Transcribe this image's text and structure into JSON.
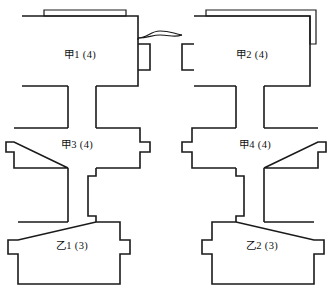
{
  "diagram": {
    "type": "floor-plan-line-drawing",
    "background_color": "#ffffff",
    "line_color": "#1a1a1a",
    "units": [
      {
        "id": "jia-1",
        "label": "甲1 (4)",
        "name_part": "甲1",
        "count": "(4)",
        "row": "top",
        "column": "left",
        "label_x": 80,
        "label_y": 56
      },
      {
        "id": "jia-2",
        "label": "甲2 (4)",
        "name_part": "甲2",
        "count": "(4)",
        "row": "top",
        "column": "right",
        "label_x": 252,
        "label_y": 56
      },
      {
        "id": "jia-3",
        "label": "甲3 (4)",
        "name_part": "甲3",
        "count": "(4)",
        "row": "middle",
        "column": "left",
        "label_x": 77,
        "label_y": 146
      },
      {
        "id": "jia-4",
        "label": "甲4 (4)",
        "name_part": "甲4",
        "count": "(4)",
        "row": "middle",
        "column": "right",
        "label_x": 255,
        "label_y": 146
      },
      {
        "id": "yi-1",
        "label": "乙1 (3)",
        "name_part": "乙1",
        "count": "(3)",
        "row": "bottom",
        "column": "left",
        "label_x": 72,
        "label_y": 247
      },
      {
        "id": "yi-2",
        "label": "乙2 (3)",
        "name_part": "乙2",
        "count": "(3)",
        "row": "bottom",
        "column": "right",
        "label_x": 262,
        "label_y": 247
      }
    ],
    "connectors": [
      {
        "id": "lens-connector",
        "between": [
          "甲1",
          "甲2"
        ],
        "shape": "lens"
      },
      {
        "id": "corridor-jia1-jia3",
        "between": [
          "甲1",
          "甲3"
        ],
        "shape": "straight-channel"
      },
      {
        "id": "corridor-jia2-jia4",
        "between": [
          "甲2",
          "甲4"
        ],
        "shape": "straight-channel"
      },
      {
        "id": "corridor-jia3-yi1",
        "between": [
          "甲3",
          "乙1"
        ],
        "shape": "jogged-channel"
      },
      {
        "id": "corridor-jia4-yi2",
        "between": [
          "甲4",
          "乙2"
        ],
        "shape": "jogged-channel"
      }
    ]
  }
}
